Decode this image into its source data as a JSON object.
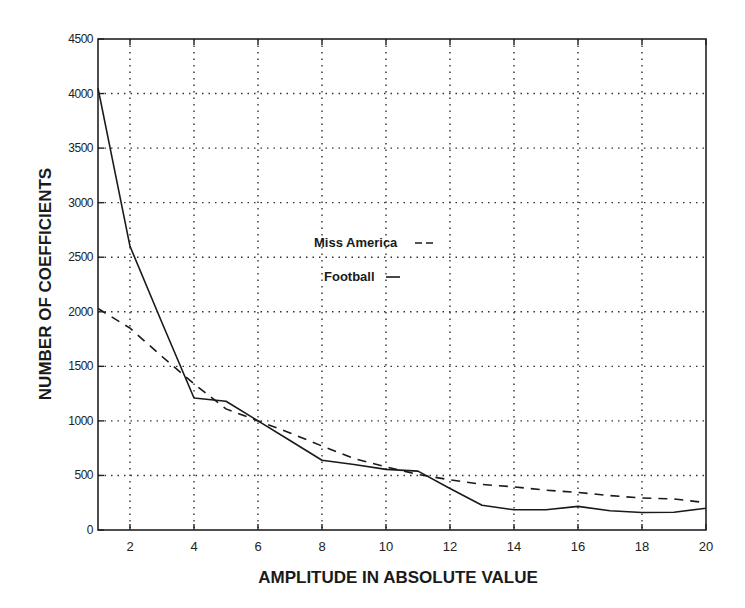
{
  "chart_data": {
    "type": "line",
    "title": "",
    "xlabel": "AMPLITUDE IN ABSOLUTE VALUE",
    "ylabel": "NUMBER OF COEFFICIENTS",
    "xlim": [
      1,
      20
    ],
    "ylim": [
      0,
      4500
    ],
    "xticks": [
      2,
      4,
      6,
      8,
      10,
      12,
      14,
      16,
      18,
      20
    ],
    "xtick_labels": [
      "2",
      "4",
      "6",
      "8",
      "10",
      "12",
      "14",
      "16",
      "18",
      "20"
    ],
    "yticks": [
      0,
      500,
      1000,
      1500,
      2000,
      2500,
      3000,
      3500,
      4000,
      4500
    ],
    "ytick_labels": [
      "0",
      "500",
      "1000",
      "1500",
      "2000",
      "2500",
      "3000",
      "3500",
      "4000",
      "4500"
    ],
    "grid": true,
    "legend_position": "inside-center-left",
    "x": [
      1,
      2,
      3,
      4,
      5,
      6,
      7,
      8,
      9,
      10,
      11,
      12,
      13,
      14,
      15,
      16,
      17,
      18,
      19,
      20
    ],
    "series": [
      {
        "name": "Miss America",
        "style": "dashed",
        "legend_label": "Miss America",
        "values": [
          2030,
          1850,
          1590,
          1340,
          1110,
          1000,
          890,
          770,
          655,
          578,
          510,
          460,
          418,
          395,
          365,
          345,
          315,
          293,
          284,
          250
        ]
      },
      {
        "name": "Football",
        "style": "solid",
        "legend_label": "Football",
        "values": [
          4050,
          2600,
          1900,
          1210,
          1180,
          1000,
          820,
          640,
          600,
          555,
          540,
          380,
          226,
          185,
          185,
          216,
          176,
          160,
          163,
          200
        ]
      }
    ]
  },
  "legend": {
    "items": [
      {
        "label": "Miss America",
        "style": "dashed"
      },
      {
        "label": "Football",
        "style": "solid"
      }
    ]
  }
}
